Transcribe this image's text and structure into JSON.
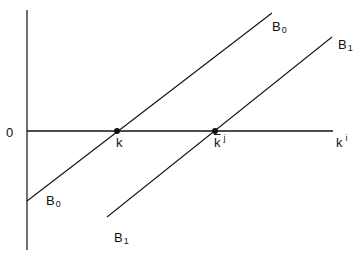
{
  "diagram": {
    "axes": {
      "origin_label": "0",
      "x_axis_label": {
        "base": "k",
        "sup": "i"
      }
    },
    "lines": [
      {
        "name": "B0",
        "base": "B",
        "sub": "0",
        "top_label": "B0",
        "bottom_label": "B0"
      },
      {
        "name": "B1",
        "base": "B",
        "sub": "1",
        "top_label": "B1",
        "bottom_label": "B1"
      }
    ],
    "points": [
      {
        "label": "k",
        "base": "k",
        "overbar": false,
        "sup": ""
      },
      {
        "label": "k-bar-j",
        "base": "k",
        "overbar": true,
        "sup": "j"
      }
    ],
    "colors": {
      "line": "#111111",
      "background": "#ffffff"
    }
  }
}
